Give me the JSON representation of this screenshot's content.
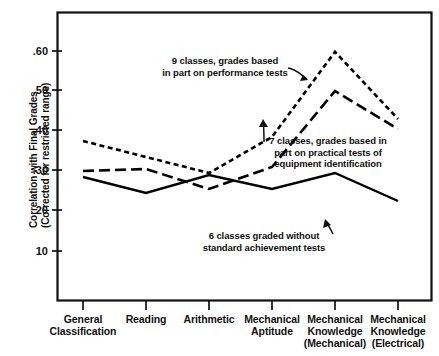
{
  "chart_data": {
    "type": "line",
    "title": "",
    "xlabel": "",
    "ylabel": "Correlation with Final Grades (Corrected for restricted range)",
    "ylabel_lines": [
      "Correlation with Final Grades",
      "(Corrected for restricted range)"
    ],
    "categories": [
      "General Classification",
      "Reading",
      "Arithmetic",
      "Mechanical Aptitude",
      "Mechanical Knowledge (Mechanical)",
      "Mechanical Knowledge (Electrical)"
    ],
    "category_lines": [
      [
        "General",
        "Classification"
      ],
      [
        "Reading"
      ],
      [
        "Arithmetic"
      ],
      [
        "Mechanical",
        "Aptitude"
      ],
      [
        "Mechanical",
        "Knowledge",
        "(Mechanical)"
      ],
      [
        "Mechanical",
        "Knowledge",
        "(Electrical)"
      ]
    ],
    "ylim": [
      0.0,
      0.68
    ],
    "ytick_values": [
      0.6,
      0.5,
      0.4,
      0.3,
      0.2,
      0.1
    ],
    "ytick_labels": [
      ".60",
      ".50",
      ".40",
      ".30",
      "20",
      "10"
    ],
    "grid": false,
    "legend_position": "inline-annotations",
    "series": [
      {
        "name": "9 classes, grades based in part on performance tests",
        "style": "short-dashed",
        "color": "#000000",
        "values": [
          0.375,
          0.335,
          0.295,
          0.385,
          0.598,
          0.43
        ]
      },
      {
        "name": "7 classes, grades based in part on practical tests of equipment identification",
        "style": "long-dashed",
        "color": "#000000",
        "values": [
          0.3,
          0.305,
          0.255,
          0.31,
          0.5,
          0.405
        ]
      },
      {
        "name": "6 classes graded without standard achievement tests",
        "style": "solid",
        "color": "#000000",
        "values": [
          0.285,
          0.245,
          0.29,
          0.255,
          0.295,
          0.225
        ]
      }
    ],
    "annotations": [
      {
        "id": "annot-9-classes",
        "lines": [
          "9 classes, grades based",
          "in part on performance tests"
        ],
        "text": "9 classes, grades based in part on performance tests"
      },
      {
        "id": "annot-7-classes",
        "lines": [
          "7 classes, grades based in",
          "part on practical tests of",
          "equipment identification"
        ],
        "text": "7 classes, grades based in part on practical tests of equipment identification"
      },
      {
        "id": "annot-6-classes",
        "lines": [
          "6 classes graded without",
          "standard achievement tests"
        ],
        "text": "6 classes graded without standard achievement tests"
      }
    ]
  }
}
